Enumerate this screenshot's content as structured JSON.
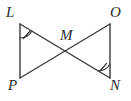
{
  "figure": {
    "background_color": "#ffffff",
    "stroke_color": "#3a3a3a",
    "label_color": "#2b2b2b",
    "vertices": [
      {
        "name": "L",
        "label": "L",
        "x": 20,
        "y": 24,
        "label_x": 6,
        "label_y": 5
      },
      {
        "name": "O",
        "label": "O",
        "x": 110,
        "y": 24,
        "label_x": 110,
        "label_y": 5
      },
      {
        "name": "M",
        "label": "M",
        "x": 65,
        "y": 51,
        "label_x": 60,
        "label_y": 28
      },
      {
        "name": "P",
        "label": "P",
        "x": 20,
        "y": 78,
        "label_x": 8,
        "label_y": 78
      },
      {
        "name": "N",
        "label": "N",
        "x": 110,
        "y": 78,
        "label_x": 110,
        "label_y": 78
      }
    ],
    "segments": [
      {
        "name": "segment-LP",
        "from": "L",
        "to": "P",
        "x1": 20,
        "y1": 24,
        "x2": 20,
        "y2": 78
      },
      {
        "name": "segment-ON",
        "from": "O",
        "to": "N",
        "x1": 110,
        "y1": 24,
        "x2": 110,
        "y2": 78
      },
      {
        "name": "segment-LN",
        "from": "L",
        "to": "N",
        "x1": 20,
        "y1": 24,
        "x2": 110,
        "y2": 78
      },
      {
        "name": "segment-OP",
        "from": "O",
        "to": "P",
        "x1": 110,
        "y1": 24,
        "x2": 20,
        "y2": 78
      }
    ],
    "angle_marks": [
      {
        "name": "angle-mark-L",
        "at": "L",
        "ticks": 1
      },
      {
        "name": "angle-mark-N",
        "at": "N",
        "ticks": 1
      }
    ]
  }
}
